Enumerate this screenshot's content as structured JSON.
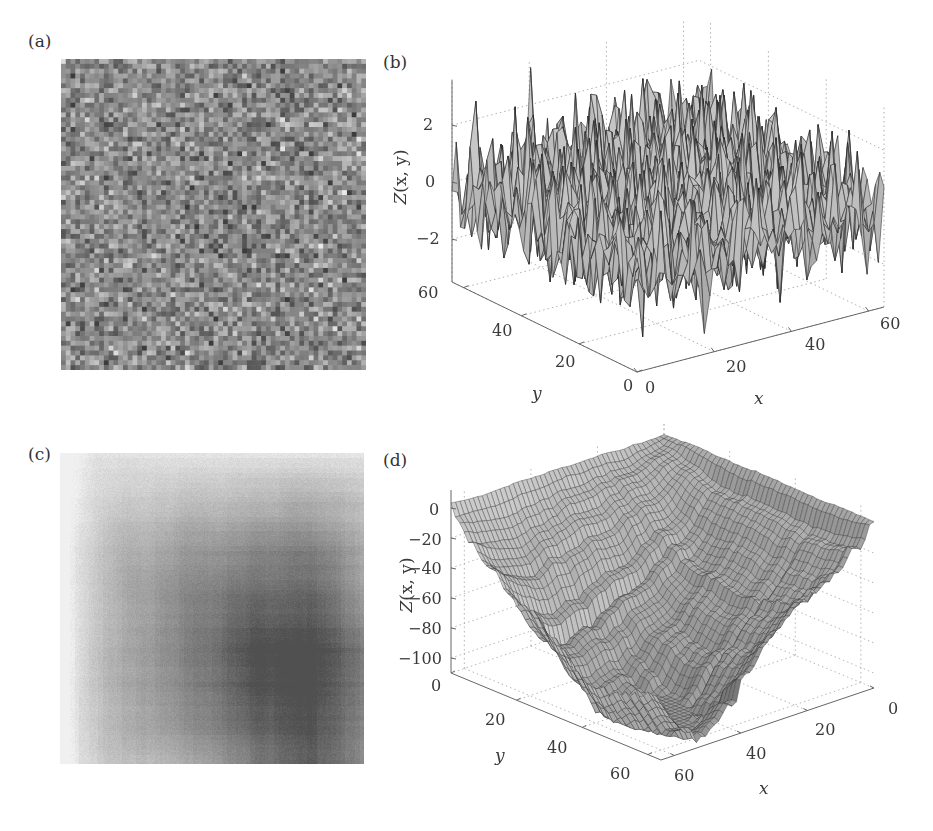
{
  "figure": {
    "panels": {
      "a": {
        "label": "(a)"
      },
      "b": {
        "label": "(b)"
      },
      "c": {
        "label": "(c)"
      },
      "d": {
        "label": "(d)"
      }
    }
  },
  "chart_data": [
    {
      "panel": "(a)",
      "type": "heatmap",
      "title": "",
      "description": "Grayscale image of uncorrelated random noise field Z(x,y), ~64x64 pixels",
      "grid_size": [
        64,
        64
      ],
      "colormap": "gray"
    },
    {
      "panel": "(b)",
      "type": "surface3d",
      "title": "",
      "xlabel": "x",
      "ylabel": "y",
      "zlabel": "Z(x, y)",
      "xticks": [
        "0",
        "20",
        "40",
        "60"
      ],
      "yticks": [
        "0",
        "20",
        "40",
        "60"
      ],
      "zticks": [
        "−2",
        "0",
        "2"
      ],
      "xlim": [
        0,
        64
      ],
      "ylim": [
        0,
        64
      ],
      "zlim": [
        -3.5,
        3.5
      ],
      "grid": true,
      "description": "Mesh surface of random white noise, values roughly within -3 to 3"
    },
    {
      "panel": "(c)",
      "type": "heatmap",
      "title": "",
      "description": "Grayscale image of smoothed/integrated surface, dark center region, lighter edges (left and bottom)",
      "grid_size": [
        64,
        64
      ],
      "colormap": "gray"
    },
    {
      "panel": "(d)",
      "type": "surface3d",
      "title": "",
      "xlabel": "x",
      "ylabel": "y",
      "zlabel": "Z(x, y)",
      "xticks": [
        "0",
        "20",
        "40",
        "60"
      ],
      "yticks": [
        "0",
        "20",
        "40",
        "60"
      ],
      "zticks": [
        "−100",
        "−80",
        "−60",
        "−40",
        "−20",
        "0"
      ],
      "xlim": [
        64,
        0
      ],
      "ylim": [
        0,
        64
      ],
      "zlim": [
        -110,
        10
      ],
      "grid": true,
      "description": "Mesh surface of integrated noise; high ridge near back corner (~0), deepest valleys near front (~-100)"
    }
  ],
  "axes": {
    "b": {
      "zticks": [
        "2",
        "0",
        "−2"
      ],
      "yticks": [
        "60",
        "40",
        "20",
        "0"
      ],
      "xticks": [
        "0",
        "20",
        "40",
        "60"
      ],
      "xlabel": "x",
      "ylabel": "y",
      "zlabel_main": "Z",
      "zlabel_args": "(x, y)"
    },
    "d": {
      "zticks": [
        "0",
        "−20",
        "−40",
        "−60",
        "−80",
        "−100"
      ],
      "yticks": [
        "0",
        "20",
        "40",
        "60"
      ],
      "xticks": [
        "60",
        "40",
        "20",
        "0"
      ],
      "xlabel": "x",
      "ylabel": "y",
      "zlabel_main": "Z",
      "zlabel_args": "(x, y)"
    }
  }
}
